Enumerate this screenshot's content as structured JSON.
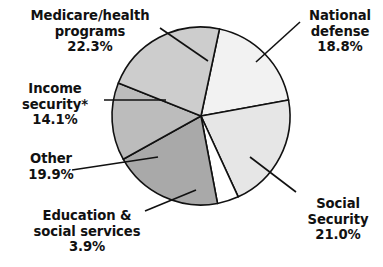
{
  "chart_data": {
    "type": "pie",
    "title": "",
    "subtitle": "",
    "xlabel": "",
    "ylabel": "",
    "legend_position": "none",
    "grid": false,
    "units": "percent",
    "start_angle_deg": 12,
    "direction": "clockwise",
    "categories": [
      "National defense",
      "Social Security",
      "Education & social services",
      "Other",
      "Income security*",
      "Medicare/health programs"
    ],
    "values": [
      18.8,
      21.0,
      3.9,
      19.9,
      14.1,
      22.3
    ],
    "colors": [
      "#f2f2f2",
      "#e6e6e6",
      "#ffffff",
      "#a9a9a9",
      "#bcbcbc",
      "#cdcdcd"
    ],
    "slices": [
      {
        "name": "National defense",
        "value": 18.8,
        "value_label": "18.8%",
        "color": "#f2f2f2"
      },
      {
        "name": "Social Security",
        "value": 21.0,
        "value_label": "21.0%",
        "color": "#e6e6e6"
      },
      {
        "name": "Education & social services",
        "value": 3.9,
        "value_label": "3.9%",
        "color": "#ffffff"
      },
      {
        "name": "Other",
        "value": 19.9,
        "value_label": "19.9%",
        "color": "#a9a9a9"
      },
      {
        "name": "Income security*",
        "value": 14.1,
        "value_label": "14.1%",
        "color": "#bcbcbc"
      },
      {
        "name": "Medicare/health programs",
        "value": 22.3,
        "value_label": "22.3%",
        "color": "#cdcdcd"
      }
    ]
  },
  "labels": {
    "medicare": {
      "line1": "Medicare/health",
      "line2": "programs",
      "line3": "22.3%"
    },
    "defense": {
      "line1": "National",
      "line2": "defense",
      "line3": "18.8%"
    },
    "income": {
      "line1": "Income",
      "line2": "security*",
      "line3": "14.1%"
    },
    "other": {
      "line1": "Other",
      "line2": "19.9%"
    },
    "education": {
      "line1": "Education &",
      "line2": "social services",
      "line3": "3.9%"
    },
    "social": {
      "line1": "Social",
      "line2": "Security",
      "line3": "21.0%"
    }
  },
  "style": {
    "stroke": "#111111",
    "text_color": "#111111",
    "background": "#ffffff"
  }
}
